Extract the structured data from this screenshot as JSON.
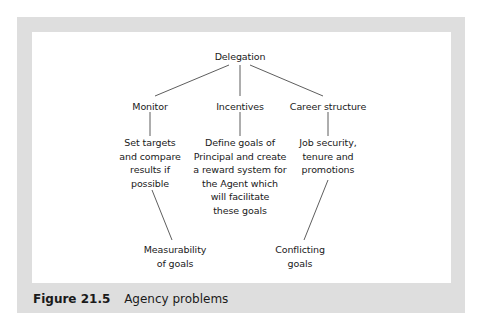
{
  "figure": {
    "caption": {
      "number": "Figure 21.5",
      "title": "Agency problems"
    },
    "colors": {
      "frame": "#dedede",
      "panel": "#ffffff",
      "line": "#333333",
      "text": "#1a1a1a"
    }
  },
  "diagram": {
    "root": "Delegation",
    "branches": [
      {
        "label": "Monitor",
        "detail": [
          "Set targets",
          "and compare",
          "results if",
          "possible"
        ],
        "problem": [
          "Measurability",
          "of goals"
        ]
      },
      {
        "label": "Incentives",
        "detail": [
          "Define goals of",
          "Principal and create",
          "a reward system for",
          "the Agent which",
          "will facilitate",
          "these goals"
        ]
      },
      {
        "label": "Career structure",
        "detail": [
          "Job security,",
          "tenure and",
          "promotions"
        ],
        "problem": [
          "Conflicting",
          "goals"
        ]
      }
    ]
  }
}
